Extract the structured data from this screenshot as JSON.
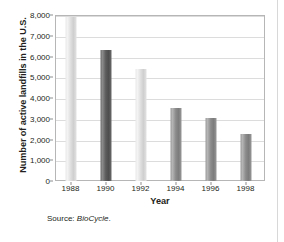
{
  "figure": {
    "source_prefix": "Source:",
    "source_name": "BioCycle",
    "source_suffix": "."
  },
  "chart_data": {
    "type": "bar",
    "title": "",
    "xlabel": "Year",
    "ylabel": "Number of active landfills in the U.S.",
    "categories": [
      "1988",
      "1990",
      "1992",
      "1994",
      "1996",
      "1998"
    ],
    "values": [
      7900,
      6300,
      5400,
      3500,
      3050,
      2250
    ],
    "ylim": [
      0,
      8000
    ],
    "ytick_labels": [
      "0",
      "1,000",
      "2,000",
      "3,000",
      "4,000",
      "5,000",
      "6,000",
      "7,000",
      "8,000"
    ],
    "ytick_values": [
      0,
      1000,
      2000,
      3000,
      4000,
      5000,
      6000,
      7000,
      8000
    ],
    "grid": true,
    "legend": "none",
    "bar_shades": [
      "light",
      "dark",
      "light",
      "mid",
      "mid",
      "mid"
    ],
    "colors": {
      "bar_light": "#dedede",
      "bar_dark": "#5c5c5c",
      "bar_mid": "#8b8b8b",
      "gridline": "#dcdcdc",
      "frame": "#b6b6b6",
      "text": "#231f20"
    }
  }
}
